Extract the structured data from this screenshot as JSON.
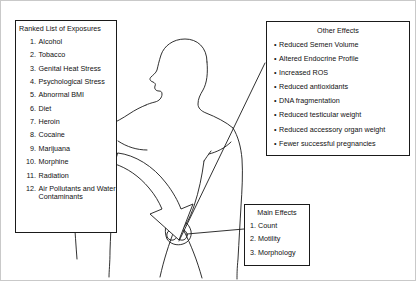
{
  "diagram": {
    "background_color": "#ffffff",
    "line_color": "#1a1a1a"
  },
  "ranked_list": {
    "title": "Ranked List of Exposures",
    "items": [
      {
        "num": "1.",
        "text": "Alcohol"
      },
      {
        "num": "2.",
        "text": "Tobacco"
      },
      {
        "num": "3.",
        "text": "Genital Heat Stress"
      },
      {
        "num": "4.",
        "text": "Psychological Stress"
      },
      {
        "num": "5.",
        "text": "Abnormal BMI"
      },
      {
        "num": "6.",
        "text": "Diet"
      },
      {
        "num": "7.",
        "text": "Heroin"
      },
      {
        "num": "8.",
        "text": "Cocaine"
      },
      {
        "num": "9.",
        "text": "Marijuana"
      },
      {
        "num": "10.",
        "text": "Morphine"
      },
      {
        "num": "11.",
        "text": "Radiation"
      },
      {
        "num": "12.",
        "text": "Air Pollutants and Water Contaminants"
      }
    ]
  },
  "other_effects": {
    "title": "Other Effects",
    "bullet": "•",
    "items": [
      "Reduced Semen Volume",
      "Altered Endocrine Profile",
      "Increased ROS",
      "Reduced antioxidants",
      "DNA fragmentation",
      "Reduced testicular weight",
      "Reduced accessory organ weight",
      "Fewer successful pregnancies"
    ]
  },
  "main_effects": {
    "title": "Main Effects",
    "items": [
      "1. Count",
      "2. Motility",
      "3. Morphology"
    ]
  },
  "illustration": {
    "subject": "male-body-outline",
    "arrow": "curved-down-arrow-to-groin",
    "connectors": [
      "testes-to-other-effects",
      "testes-to-main-effects"
    ]
  }
}
